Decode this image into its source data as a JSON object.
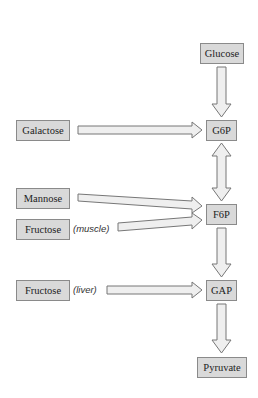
{
  "diagram": {
    "type": "metabolic-pathway",
    "nodes": {
      "glucose": "Glucose",
      "g6p": "G6P",
      "f6p": "F6P",
      "gap": "GAP",
      "pyruvate": "Pyruvate",
      "galactose": "Galactose",
      "mannose": "Mannose",
      "fructose_muscle": "Fructose",
      "fructose_liver": "Fructose"
    },
    "annotations": {
      "muscle": "(muscle)",
      "liver": "(liver)"
    },
    "edges": [
      {
        "from": "Glucose",
        "to": "G6P",
        "style": "single"
      },
      {
        "from": "G6P",
        "to": "F6P",
        "style": "double"
      },
      {
        "from": "F6P",
        "to": "GAP",
        "style": "single"
      },
      {
        "from": "GAP",
        "to": "Pyruvate",
        "style": "single"
      },
      {
        "from": "Galactose",
        "to": "G6P",
        "style": "single"
      },
      {
        "from": "Mannose",
        "to": "F6P",
        "style": "single"
      },
      {
        "from": "Fructose (muscle)",
        "to": "F6P",
        "style": "single"
      },
      {
        "from": "Fructose (liver)",
        "to": "GAP",
        "style": "single"
      }
    ],
    "colors": {
      "box_fill": "#d9d9d9",
      "box_border": "#8a8a8a",
      "arrow_fill": "#efefef",
      "arrow_stroke": "#777777"
    }
  }
}
